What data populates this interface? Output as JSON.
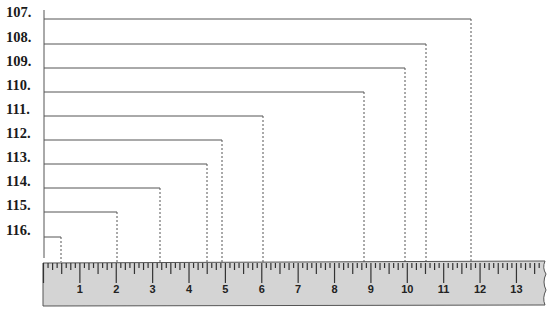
{
  "diagram": {
    "type": "ruler-measurement-exercise",
    "ruler": {
      "unit_px": 36.38,
      "origin_x": 43.5,
      "numbers": [
        "1",
        "2",
        "3",
        "4",
        "5",
        "6",
        "7",
        "8",
        "9",
        "10",
        "11",
        "12",
        "13"
      ],
      "fill_color": "#d4d4d4",
      "tick_color": "#333333",
      "ticks_per_unit": 8
    },
    "questions": [
      {
        "label": "107.",
        "y": 19,
        "end_x": 471
      },
      {
        "label": "108.",
        "y": 44,
        "end_x": 426
      },
      {
        "label": "109.",
        "y": 68,
        "end_x": 405
      },
      {
        "label": "110.",
        "y": 92,
        "end_x": 364
      },
      {
        "label": "111.",
        "y": 116,
        "end_x": 263
      },
      {
        "label": "112.",
        "y": 140,
        "end_x": 222
      },
      {
        "label": "113.",
        "y": 164,
        "end_x": 207
      },
      {
        "label": "114.",
        "y": 188,
        "end_x": 160
      },
      {
        "label": "115.",
        "y": 212,
        "end_x": 117
      },
      {
        "label": "116.",
        "y": 237,
        "end_x": 61
      }
    ],
    "line_color": "#555555"
  }
}
